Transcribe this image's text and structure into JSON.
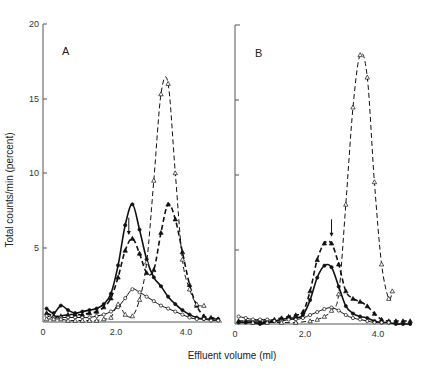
{
  "chart_data": [
    {
      "panel": "A",
      "type": "line",
      "xlabel": "Effluent volume (ml)",
      "ylabel": "Total counts/min (percent)",
      "xlim": [
        0,
        4.9
      ],
      "ylim": [
        0,
        20
      ],
      "xticks": [
        "0",
        "2.0",
        "4.0"
      ],
      "xtick_values": [
        0,
        2.0,
        4.0
      ],
      "yticks": [
        "5",
        "10",
        "15",
        "20"
      ],
      "ytick_values": [
        5,
        10,
        15,
        20
      ],
      "annotation": {
        "type": "arrow",
        "x": 2.4,
        "y_from": 7.0,
        "y_to": 5.9
      },
      "series": [
        {
          "name": "filled-circle-solid",
          "marker": "filled-circle",
          "style": "solid",
          "x": [
            0.1,
            0.3,
            0.5,
            0.7,
            0.9,
            1.1,
            1.3,
            1.5,
            1.7,
            1.9,
            2.1,
            2.3,
            2.5,
            2.7,
            2.9,
            3.1,
            3.3,
            3.5,
            3.7,
            3.9,
            4.1,
            4.3,
            4.5,
            4.7,
            4.9
          ],
          "y": [
            0.9,
            0.6,
            1.1,
            0.8,
            0.6,
            0.7,
            0.8,
            0.9,
            1.2,
            1.9,
            3.8,
            6.5,
            7.9,
            6.2,
            4.2,
            3.0,
            2.4,
            1.7,
            1.2,
            0.8,
            0.5,
            0.3,
            0.2,
            0.2,
            0.2
          ]
        },
        {
          "name": "filled-triangle-dashed",
          "marker": "filled-triangle",
          "style": "dashed",
          "x": [
            0.1,
            0.3,
            0.5,
            0.7,
            0.9,
            1.1,
            1.3,
            1.5,
            1.7,
            1.9,
            2.1,
            2.3,
            2.5,
            2.7,
            2.9,
            3.1,
            3.3,
            3.5,
            3.7,
            3.9,
            4.1,
            4.3,
            4.5,
            4.7,
            4.9
          ],
          "y": [
            0.6,
            0.4,
            0.4,
            0.5,
            0.5,
            0.5,
            0.6,
            0.7,
            1.0,
            1.6,
            3.0,
            4.8,
            5.6,
            4.6,
            3.3,
            3.5,
            6.0,
            7.9,
            6.9,
            4.7,
            2.5,
            1.1,
            0.4,
            0.3,
            0.2
          ]
        },
        {
          "name": "open-circle-solid",
          "marker": "open-circle",
          "style": "solid",
          "x": [
            0.1,
            0.3,
            0.5,
            0.7,
            0.9,
            1.1,
            1.3,
            1.5,
            1.7,
            1.9,
            2.1,
            2.3,
            2.5,
            2.7,
            2.9,
            3.1,
            3.3,
            3.5,
            3.7,
            3.9,
            4.1,
            4.3,
            4.5,
            4.7,
            4.9
          ],
          "y": [
            0.4,
            0.3,
            0.3,
            0.3,
            0.3,
            0.3,
            0.3,
            0.4,
            0.5,
            0.7,
            1.0,
            1.6,
            2.2,
            2.0,
            1.7,
            1.4,
            1.1,
            0.9,
            0.7,
            0.5,
            0.3,
            0.2,
            0.2,
            0.1,
            0.1
          ]
        },
        {
          "name": "open-triangle-dashed",
          "marker": "open-triangle",
          "style": "dashed",
          "x": [
            0.1,
            0.3,
            0.5,
            0.7,
            0.9,
            1.1,
            1.3,
            1.5,
            1.7,
            1.9,
            2.1,
            2.3,
            2.5,
            2.7,
            2.9,
            3.1,
            3.3,
            3.5,
            3.7,
            3.9,
            4.1,
            4.3,
            4.5
          ],
          "y": [
            0.2,
            0.2,
            0.2,
            0.1,
            0.1,
            0.1,
            0.1,
            0.1,
            0.2,
            0.3,
            1.2,
            0.5,
            0.4,
            1.5,
            4.0,
            9.5,
            15.3,
            16.0,
            10.0,
            4.2,
            2.2,
            1.2,
            1.1
          ]
        }
      ]
    },
    {
      "panel": "B",
      "type": "line",
      "xlabel": "Effluent volume (ml)",
      "ylabel": "",
      "xlim": [
        0,
        4.9
      ],
      "ylim": [
        0,
        20
      ],
      "xticks": [
        "0",
        "2.0",
        "4.0"
      ],
      "xtick_values": [
        0,
        2.0,
        4.0
      ],
      "yticks": [
        "",
        "",
        "",
        ""
      ],
      "ytick_values": [
        5,
        10,
        15,
        20
      ],
      "annotation": {
        "type": "arrow",
        "x": 2.7,
        "y_from": 7.0,
        "y_to": 5.9
      },
      "series": [
        {
          "name": "filled-triangle-dashed",
          "marker": "filled-triangle",
          "style": "dashed",
          "x": [
            0.1,
            0.3,
            0.5,
            0.7,
            0.9,
            1.1,
            1.3,
            1.5,
            1.7,
            1.9,
            2.1,
            2.3,
            2.5,
            2.7,
            2.9,
            3.1,
            3.3,
            3.5,
            3.7,
            3.9,
            4.1,
            4.3,
            4.5,
            4.7,
            4.9
          ],
          "y": [
            0.2,
            0.2,
            0.2,
            0.2,
            0.2,
            0.3,
            0.4,
            0.5,
            0.6,
            0.8,
            2.2,
            4.3,
            5.4,
            5.4,
            4.0,
            2.2,
            1.7,
            1.5,
            1.2,
            0.7,
            0.3,
            0.2,
            0.2,
            0.2,
            0.2
          ]
        },
        {
          "name": "filled-circle-solid",
          "marker": "filled-circle",
          "style": "solid",
          "x": [
            0.1,
            0.3,
            0.5,
            0.7,
            0.9,
            1.1,
            1.3,
            1.5,
            1.7,
            1.9,
            2.1,
            2.3,
            2.5,
            2.7,
            2.9,
            3.1,
            3.3,
            3.5,
            3.7,
            3.9,
            4.1,
            4.3,
            4.5,
            4.7,
            4.9
          ],
          "y": [
            0.1,
            0.1,
            0.1,
            0.0,
            0.1,
            0.2,
            0.3,
            0.4,
            0.4,
            0.6,
            1.6,
            3.1,
            3.9,
            3.8,
            2.5,
            1.2,
            0.7,
            0.5,
            0.4,
            0.2,
            0.1,
            0.1,
            0.0,
            0.0,
            0.0
          ]
        },
        {
          "name": "open-circle-solid",
          "marker": "open-circle",
          "style": "solid",
          "x": [
            0.1,
            0.3,
            0.5,
            0.7,
            0.9,
            1.1,
            1.3,
            1.5,
            1.7,
            1.9,
            2.1,
            2.3,
            2.5,
            2.7,
            2.9,
            3.1,
            3.3,
            3.5,
            3.7,
            3.9,
            4.1,
            4.3
          ],
          "y": [
            0.5,
            0.4,
            0.3,
            0.3,
            0.3,
            0.2,
            0.2,
            0.3,
            0.3,
            0.4,
            0.6,
            0.8,
            1.0,
            1.1,
            0.9,
            0.6,
            0.4,
            0.3,
            0.2,
            0.1,
            0.1,
            0.1
          ]
        },
        {
          "name": "open-triangle-dashed",
          "marker": "open-triangle",
          "style": "dashed",
          "x": [
            0.5,
            0.9,
            1.3,
            1.7,
            2.1,
            2.3,
            2.5,
            2.7,
            2.9,
            3.1,
            3.3,
            3.5,
            3.7,
            3.9,
            4.1,
            4.3,
            4.4
          ],
          "y": [
            0.1,
            0.1,
            0.1,
            0.1,
            0.2,
            0.3,
            0.5,
            0.9,
            2.0,
            8.0,
            14.5,
            18.0,
            16.5,
            9.5,
            4.0,
            1.7,
            2.2
          ]
        }
      ]
    }
  ],
  "panels": {
    "a_label": "A",
    "b_label": "B"
  },
  "axes": {
    "ylabel": "Total counts/min (percent)",
    "xlabel": "Effluent volume (ml)",
    "a_yticks": [
      "5",
      "10",
      "15",
      "20"
    ],
    "a_xticks": [
      "0",
      "2.0",
      "4.0"
    ],
    "b_xticks": [
      "0",
      "2.0",
      "4.0"
    ]
  }
}
